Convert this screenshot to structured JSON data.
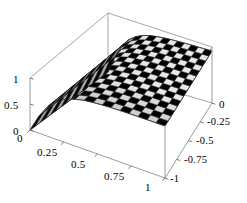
{
  "figure": {
    "kind": "surface-plot-3d",
    "background_color": "#ffffff",
    "box_line_color": "#888888",
    "mesh_line_color": "#1a1a1a",
    "surface_light_color": "#e8e8e8",
    "surface_mid_color": "#c4c4c4",
    "surface_dark_color": "#8a8a8a"
  },
  "axes": {
    "z": {
      "name": "z-axis",
      "ticks": [
        "1",
        "0.5",
        "0"
      ],
      "values": [
        1,
        0.5,
        0
      ],
      "range": [
        0,
        1
      ]
    },
    "x": {
      "name": "x-axis",
      "ticks": [
        "0",
        "0.25",
        "0.5",
        "0.75",
        "1"
      ],
      "values": [
        0,
        0.25,
        0.5,
        0.75,
        1
      ],
      "range": [
        0,
        1
      ]
    },
    "y": {
      "name": "y-axis",
      "ticks": [
        "0",
        "-0.25",
        "-0.5",
        "-0.75",
        "-1"
      ],
      "values": [
        0,
        -0.25,
        -0.5,
        -0.75,
        -1
      ],
      "range": [
        -1,
        0
      ]
    }
  },
  "chart_data": {
    "type": "surface",
    "title": "",
    "xlabel": "",
    "ylabel": "",
    "zlabel": "",
    "grid": false,
    "legend": false,
    "xlim": [
      0,
      1
    ],
    "ylim": [
      -1,
      0
    ],
    "zlim": [
      0,
      1
    ],
    "xticks": [
      0,
      0.25,
      0.5,
      0.75,
      1
    ],
    "xticklabels": [
      "0",
      "0.25",
      "0.5",
      "0.75",
      "1"
    ],
    "yticks": [
      0,
      -0.25,
      -0.5,
      -0.75,
      -1
    ],
    "yticklabels": [
      "0",
      "-0.25",
      "-0.5",
      "-0.75",
      "-1"
    ],
    "zticks": [
      0,
      0.5,
      1
    ],
    "zticklabels": [
      "0",
      "0.5",
      "1"
    ],
    "mesh_divisions_x": 15,
    "mesh_divisions_y": 15,
    "x": [
      0,
      0.0667,
      0.1333,
      0.2,
      0.2667,
      0.3333,
      0.4,
      0.4667,
      0.5333,
      0.6,
      0.6667,
      0.7333,
      0.8,
      0.8667,
      0.9333,
      1
    ],
    "y": [
      -1,
      -0.9333,
      -0.8667,
      -0.8,
      -0.7333,
      -0.6667,
      -0.6,
      -0.5333,
      -0.4667,
      -0.4,
      -0.3333,
      -0.2667,
      -0.2,
      -0.1333,
      -0.0667,
      0
    ],
    "z_profile_along_x": [
      0.0,
      0.33,
      0.58,
      0.74,
      0.84,
      0.9,
      0.94,
      0.96,
      0.975,
      0.985,
      0.99,
      0.994,
      0.997,
      0.998,
      0.999,
      1.0
    ],
    "z_constant_along_y": true
  }
}
